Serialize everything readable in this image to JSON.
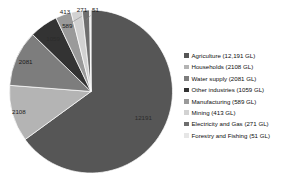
{
  "chart_data": {
    "type": "pie",
    "title": "",
    "unit": "GL",
    "categories": [
      "Agriculture",
      "Households",
      "Water supply",
      "Other industries",
      "Manufacturing",
      "Mining",
      "Electricity and Gas",
      "Forestry and Fishing"
    ],
    "values": [
      12191,
      2108,
      2081,
      1059,
      589,
      413,
      271,
      51
    ],
    "data_labels": [
      "12191",
      "2108",
      "2081",
      "1059",
      "589",
      "413",
      "271",
      "51"
    ],
    "legend_labels": [
      "Agriculture (12,191 GL)",
      "Households (2108 GL)",
      "Water supply (2081 GL)",
      "Other industries (1059 GL)",
      "Manufacturing (589 GL)",
      "Mining (413 GL)",
      "Electricity and Gas (271 GL)",
      "Forestry and Fishing (51 GL)"
    ],
    "colors": [
      "#565656",
      "#b4b4b4",
      "#7d7d7d",
      "#333333",
      "#9a9a9a",
      "#d2d2d2",
      "#6e6e6e",
      "#e6e6e6"
    ],
    "legend_position": "right",
    "start_angle_deg": 0,
    "direction": "clockwise",
    "total": 18763,
    "grid": false
  },
  "legend": {
    "items": [
      {
        "label": "Agriculture (12,191 GL)",
        "color": "#565656"
      },
      {
        "label": "Households (2108 GL)",
        "color": "#b4b4b4"
      },
      {
        "label": "Water supply (2081 GL)",
        "color": "#7d7d7d"
      },
      {
        "label": "Other industries (1059 GL)",
        "color": "#333333"
      },
      {
        "label": "Manufacturing (589 GL)",
        "color": "#9a9a9a"
      },
      {
        "label": "Mining (413 GL)",
        "color": "#d2d2d2"
      },
      {
        "label": "Electricity and Gas (271 GL)",
        "color": "#6e6e6e"
      },
      {
        "label": "Forestry and Fishing (51 GL)",
        "color": "#e6e6e6"
      }
    ]
  },
  "labels": {
    "agriculture": "12191",
    "households": "2108",
    "water_supply": "2081",
    "other_industries": "1059",
    "manufacturing": "589",
    "mining": "413",
    "electricity_and_gas": "271",
    "forestry_and_fishing": "51"
  }
}
